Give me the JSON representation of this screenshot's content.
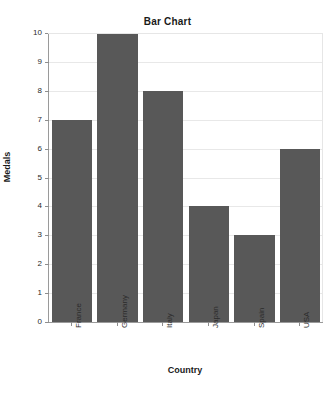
{
  "chart_data": {
    "type": "bar",
    "title": "Bar Chart",
    "xlabel": "Country",
    "ylabel": "Medals",
    "categories": [
      "France",
      "Germany",
      "Italy",
      "Japan",
      "Spain",
      "USA"
    ],
    "values": [
      7,
      10,
      8,
      4,
      3,
      6
    ],
    "ylim": [
      0,
      10
    ],
    "ytick_labels": [
      "0",
      "1",
      "2",
      "3",
      "4",
      "5",
      "6",
      "7",
      "8",
      "9",
      "10"
    ],
    "ytick_values": [
      0,
      1,
      2,
      3,
      4,
      5,
      6,
      7,
      8,
      9,
      10
    ],
    "grid": true,
    "grid_axis": "y",
    "legend": false,
    "bar_color": "#585858",
    "grid_color": "#e8e8e8",
    "axis_color": "#9a9a9a",
    "background_color": "#ffffff",
    "text_color": "#1a1a1a",
    "xtick_rotation": -90
  }
}
